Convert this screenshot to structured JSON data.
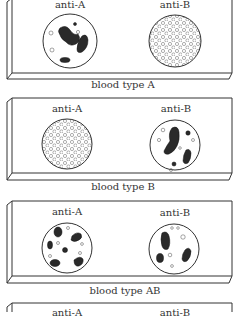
{
  "slides": [
    {
      "caption": "blood type A",
      "wells": [
        {
          "label": "anti-A",
          "result": "agglutinated"
        },
        {
          "label": "anti-B",
          "result": "not agglutinated"
        }
      ]
    },
    {
      "caption": "blood type B",
      "wells": [
        {
          "label": "anti-A",
          "result": "not agglutinated"
        },
        {
          "label": "anti-B",
          "result": "agglutinated"
        }
      ]
    },
    {
      "caption": "blood type AB",
      "wells": [
        {
          "label": "anti-A",
          "result": "agglutinated"
        },
        {
          "label": "anti-B",
          "result": "agglutinated"
        }
      ]
    },
    {
      "caption": "",
      "wells": [
        {
          "label": "anti-A"
        },
        {
          "label": "anti-B"
        }
      ]
    }
  ]
}
